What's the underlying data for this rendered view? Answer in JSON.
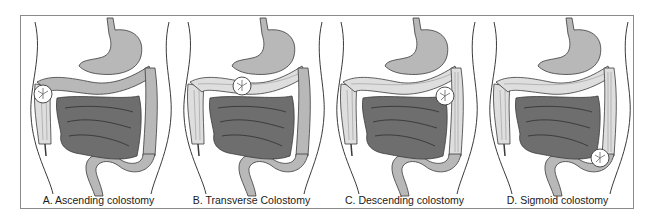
{
  "figure": {
    "panels": [
      {
        "id": "A",
        "label": "A. Ascending colostomy",
        "stoma_site": "ascending"
      },
      {
        "id": "B",
        "label": "B. Transverse Colostomy",
        "stoma_site": "transverse"
      },
      {
        "id": "C",
        "label": "C. Descending colostomy",
        "stoma_site": "descending"
      },
      {
        "id": "D",
        "label": "D. Sigmoid colostomy",
        "stoma_site": "sigmoid"
      }
    ],
    "colors": {
      "frame": "#8a8a8a",
      "outline": "#3a3a3a",
      "functional_bowel": "#b8b8b8",
      "bypassed_bowel": "#dedede",
      "small_intestine": "#6e6e6e",
      "stoma": "#ffffff"
    }
  }
}
